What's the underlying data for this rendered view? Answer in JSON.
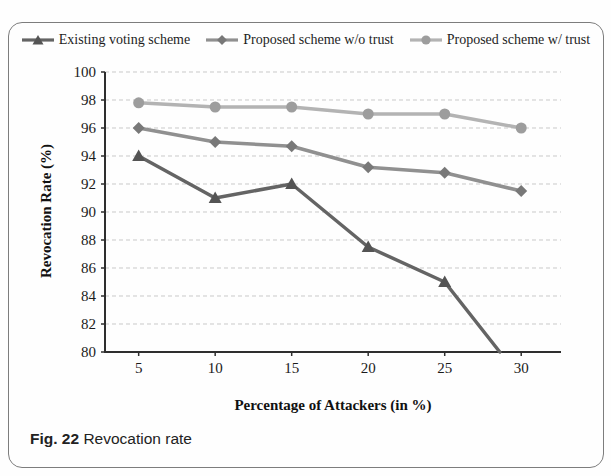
{
  "figure": {
    "caption_label": "Fig. 22",
    "caption_text": "Revocation rate"
  },
  "chart_data": {
    "type": "line",
    "title": "",
    "xlabel": "Percentage of Attackers (in %)",
    "ylabel": "Revocation Rate (%)",
    "x": [
      5,
      10,
      15,
      20,
      25,
      30
    ],
    "xticks": [
      5,
      10,
      15,
      20,
      25,
      30
    ],
    "ylim": [
      80,
      100
    ],
    "ytick_step": 2,
    "grid": "horizontal-dashed",
    "legend_position": "top",
    "series": [
      {
        "name": "Existing voting scheme",
        "marker": "triangle",
        "line_color": "#646464",
        "marker_color": "#545454",
        "values": [
          94,
          91,
          92,
          87.5,
          85,
          null
        ],
        "exits_bottom_axis_at_x": 28.6
      },
      {
        "name": "Proposed scheme w/o trust",
        "marker": "diamond",
        "line_color": "#909090",
        "marker_color": "#787878",
        "values": [
          96,
          95,
          94.7,
          93.2,
          92.8,
          91.5
        ]
      },
      {
        "name": "Proposed scheme w/ trust",
        "marker": "circle",
        "line_color": "#b3b3b3",
        "marker_color": "#9d9d9d",
        "values": [
          97.8,
          97.5,
          97.5,
          97,
          97,
          96
        ]
      }
    ],
    "colors": {
      "axis": "#2e2e2e",
      "gridline": "#c9c9c9",
      "text": "#1b1b1b"
    }
  }
}
